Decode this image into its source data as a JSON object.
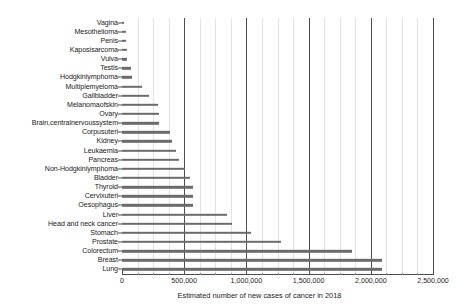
{
  "chart_data": {
    "type": "bar",
    "orientation": "horizontal",
    "title": "",
    "xlabel": "Estimated number of new cases of cancer in 2018",
    "ylabel": "",
    "xlim": [
      0,
      2500000
    ],
    "grid": true,
    "legend": null,
    "bar_color": "#6b6b6b",
    "axis_color": "#4d4d4d",
    "gridline_color": "#4d4d4d",
    "minor_gridline_color": "#e2e2e2",
    "xticks": [
      {
        "value": 0,
        "label": "0"
      },
      {
        "value": 500000,
        "label": "500,000"
      },
      {
        "value": 1000000,
        "label": "1,000,000"
      },
      {
        "value": 1500000,
        "label": "1,500,000"
      },
      {
        "value": 2000000,
        "label": "2,000,000"
      },
      {
        "value": 2500000,
        "label": "2,500,000"
      }
    ],
    "minor_xticks": [
      125000,
      250000,
      375000,
      625000,
      750000,
      875000,
      1125000,
      1250000,
      1375000,
      1625000,
      1750000,
      1875000,
      2125000,
      2250000,
      2375000
    ],
    "categories": [
      "Vagina",
      "Mesothelioma",
      "Penis",
      "Kaposisarcoma",
      "Vulva",
      "Testis",
      "Hodgkinlymphoma",
      "Multiplemyeloma",
      "Gallbladder",
      "Melanomaofskin",
      "Ovary",
      "Brain,centralnervoussystem",
      "Corpusuteri",
      "Kidney",
      "Leukaemia",
      "Pancreas",
      "Non-Hodgkinlymphoma",
      "Bladder",
      "Thyroid",
      "Cervixuteri",
      "Oesophagus",
      "Liver",
      "Head and neck cancer",
      "Stomach",
      "Prostate",
      "Colorectum",
      "Breast",
      "Lung"
    ],
    "values": [
      18000,
      30000,
      34000,
      42000,
      44000,
      71000,
      80000,
      160000,
      219000,
      288000,
      295000,
      297000,
      382000,
      403000,
      437000,
      459000,
      510000,
      549000,
      567000,
      570000,
      572000,
      841000,
      887000,
      1034000,
      1276000,
      1849000,
      2089000,
      2094000
    ]
  }
}
